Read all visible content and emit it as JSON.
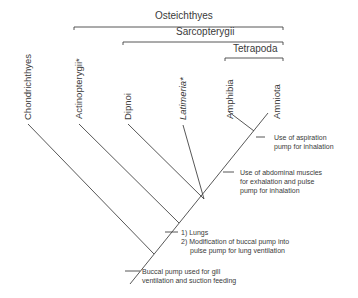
{
  "groups": {
    "osteichthyes": "Osteichthyes",
    "sarcopterygii": "Sarcopterygii",
    "tetrapoda": "Tetrapoda"
  },
  "taxa": [
    {
      "name": "Chondrichthyes",
      "italic": false
    },
    {
      "name": "Actinopterygii*",
      "italic": false
    },
    {
      "name": "Dipnoi",
      "italic": false
    },
    {
      "name": "Latimeria*",
      "italic": true
    },
    {
      "name": "Amphibia",
      "italic": false
    },
    {
      "name": "Amniota",
      "italic": false
    }
  ],
  "characters": {
    "aspiration": [
      "Use of aspiration",
      "pump for inhalation"
    ],
    "abdominal": [
      "Use of abdominal muscles",
      "for exhalation and pulse",
      "pump for inhalation"
    ],
    "lungs": [
      "1)  Lungs",
      "2)  Modification of buccal pump into",
      "pulse pump for lung ventilation"
    ],
    "buccal": [
      "Buccal pump used for gill",
      "ventilation and suction feeding"
    ]
  }
}
